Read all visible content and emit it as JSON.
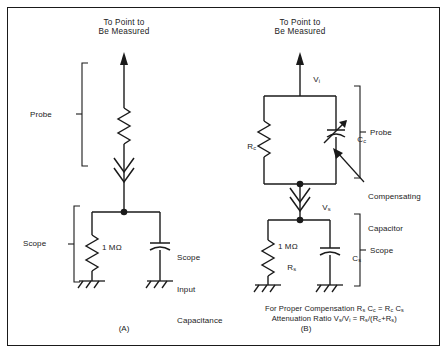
{
  "figure": {
    "title_a": "To Point to\nBe Measured",
    "title_b": "To Point to\nBe Measured",
    "caption_a": "(A)",
    "caption_b": "(B)",
    "border_color": "#1a1a1a",
    "line_color": "#1a1a1a",
    "background": "#ffffff"
  },
  "circuit_a": {
    "probe_label": "Probe",
    "scope_label": "Scope",
    "resistor_value": "1 MΩ",
    "capacitor_label": "Scope\nInput\nCapacitance",
    "capacitor_label_line1": "Scope",
    "capacitor_label_line2": "Input",
    "capacitor_label_line3": "Capacitance"
  },
  "circuit_b": {
    "probe_label": "Probe",
    "scope_label": "Scope",
    "input_voltage": "V",
    "input_voltage_sub": "i",
    "scope_voltage": "V",
    "scope_voltage_sub": "s",
    "probe_resistor": "R",
    "probe_resistor_sub": "c",
    "comp_capacitor": "C",
    "comp_capacitor_sub": "c",
    "comp_capacitor_callout_line1": "Compensating",
    "comp_capacitor_callout_line2": "Capacitor",
    "scope_resistor_value": "1 MΩ",
    "scope_resistor": "R",
    "scope_resistor_sub": "s",
    "scope_capacitor": "C",
    "scope_capacitor_sub": "s"
  },
  "formulas": {
    "line1_prefix": "For Proper Compensation R",
    "line1_sub1": "s",
    "line1_mid1": " C",
    "line1_sub2": "c",
    "line1_mid2": " = R",
    "line1_sub3": "c",
    "line1_mid3": " C",
    "line1_sub4": "s",
    "line2_prefix": "Attenuation Ratio V",
    "line2_sub1": "s",
    "line2_mid1": "/V",
    "line2_sub2": "i",
    "line2_mid2": " = R",
    "line2_sub3": "s",
    "line2_mid3": "/(R",
    "line2_sub4": "c",
    "line2_mid4": "+R",
    "line2_sub5": "s",
    "line2_suffix": ")"
  }
}
